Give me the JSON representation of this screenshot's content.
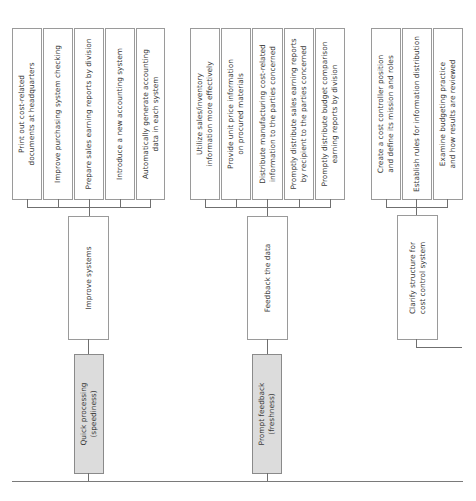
{
  "diagram": {
    "type": "tree",
    "orientation": "rotated-90-ccw",
    "baseline_color": "#7a7a7a",
    "groups": [
      {
        "root": {
          "label": "Quick processing\n(speediness)",
          "style": "grey"
        },
        "middle": {
          "label": "Improve systems"
        },
        "leaves": [
          {
            "label": "Print out cost-related\ndocuments at headquarters"
          },
          {
            "label": "Improve purchasing system checking"
          },
          {
            "label": "Prepare sales earning reports by division"
          },
          {
            "label": "Introduce a new accounting system"
          },
          {
            "label": "Automatically generate accounting\ndata in each system"
          }
        ]
      },
      {
        "root": {
          "label": "Prompt feedback\n(freshness)",
          "style": "grey"
        },
        "middle": {
          "label": "Feedback the data"
        },
        "leaves": [
          {
            "label": "Utilize sales/inventory\ninformation more effectively"
          },
          {
            "label": "Provide unit price information\non procured materials"
          },
          {
            "label": "Distribute manufacturing cost-related\ninformation to the parties concerned"
          },
          {
            "label": "Promptly distribute sales earning reports\nby recipient to the parties concerned"
          },
          {
            "label": "Promptly distribute budget comparison\nearning reports by division"
          }
        ]
      },
      {
        "middle": {
          "label": "Clarify structure for\ncost control system"
        },
        "leaves": [
          {
            "label": "Create a cost controller position\nand define its mission and roles"
          },
          {
            "label": "Establish rules for information distribution"
          },
          {
            "label": "Examine budgeting practice\nand how results are reviewed"
          }
        ]
      }
    ]
  }
}
